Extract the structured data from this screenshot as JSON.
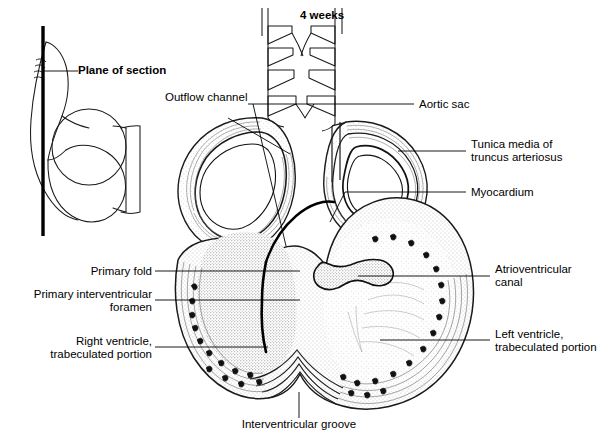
{
  "figure": {
    "title": "4 weeks",
    "plane_label": "Plane of section",
    "background_color": "#ffffff",
    "ink_color": "#000000",
    "stipple_color": "#7a7a7a"
  },
  "inset": {
    "name": "embryo-orientation-inset",
    "section_plane_line_color": "#000000"
  },
  "labels": {
    "plane_of_section": "Plane of section",
    "outflow_channel": "Outflow channel",
    "aortic_sac": "Aortic sac",
    "tunica_media_line1": "Tunica media of",
    "tunica_media_line2": "truncus arteriosus",
    "myocardium": "Myocardium",
    "primary_fold": "Primary fold",
    "primary_iv_foramen_line1": "Primary interventricular",
    "primary_iv_foramen_line2": "foramen",
    "right_ventricle_line1": "Right ventricle,",
    "right_ventricle_line2": "trabeculated portion",
    "atrioventricular_line1": "Atrioventricular",
    "atrioventricular_line2": "canal",
    "left_ventricle_line1": "Left ventricle,",
    "left_ventricle_line2": "trabeculated portion",
    "interventricular_groove": "Interventricular groove",
    "stage_title": "4 weeks"
  }
}
